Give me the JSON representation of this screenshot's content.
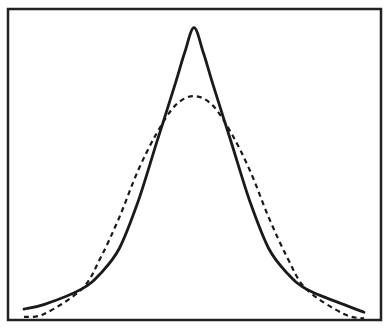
{
  "chart_data": {
    "type": "line",
    "title": "",
    "xlabel": "",
    "ylabel": "",
    "grid": false,
    "legend": null,
    "xlim": [
      -5,
      5
    ],
    "ylim": [
      0,
      1.0
    ],
    "frame": {
      "left": 8,
      "top": 9,
      "right": 381,
      "bottom": 320,
      "color": "#222222"
    },
    "series": [
      {
        "name": "sharp-peaked curve (Lorentzian-like)",
        "style": "solid",
        "color": "#1a1a1a",
        "x": [
          -4.55,
          -4,
          -3,
          -2.5,
          -2,
          -1.5,
          -1,
          -0.5,
          -0.25,
          0,
          0.25,
          0.5,
          1,
          1.5,
          2,
          2.5,
          3,
          4,
          4.55
        ],
        "values": [
          0.035,
          0.05,
          0.1,
          0.15,
          0.23,
          0.38,
          0.57,
          0.76,
          0.86,
          0.94,
          0.86,
          0.76,
          0.57,
          0.38,
          0.23,
          0.15,
          0.1,
          0.05,
          0.025
        ]
      },
      {
        "name": "broad curve (Gaussian-like)",
        "style": "dashed",
        "color": "#1a1a1a",
        "x": [
          -4.55,
          -4,
          -3,
          -2.5,
          -2,
          -1.5,
          -1,
          -0.5,
          0,
          0.5,
          1,
          1.5,
          2,
          2.5,
          3,
          4,
          4.55
        ],
        "values": [
          0.01,
          0.02,
          0.1,
          0.2,
          0.33,
          0.48,
          0.6,
          0.69,
          0.72,
          0.69,
          0.6,
          0.48,
          0.33,
          0.2,
          0.1,
          0.02,
          0.005
        ]
      }
    ]
  }
}
